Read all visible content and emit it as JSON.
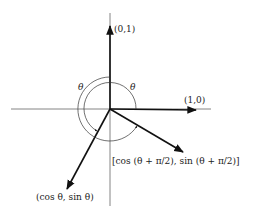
{
  "diagram": {
    "type": "rotation-of-unit-vectors",
    "labels": {
      "e2": "(0,1)",
      "e1": "(1,0)",
      "rotated_e1": "(cos θ, sin θ)",
      "rotated_e2": "[cos (θ + π/2), sin (θ + π/2)]",
      "theta_outer": "θ",
      "theta_inner": "θ"
    },
    "colors": {
      "axis": "#555555",
      "vector": "#111111",
      "arc": "#333333",
      "background": "#ffffff"
    }
  }
}
